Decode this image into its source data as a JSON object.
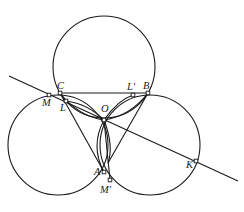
{
  "diagram": {
    "type": "geometry",
    "colors": {
      "stroke": "#1a1a1a",
      "background": "#ffffff",
      "point_fill": "#ffffff"
    },
    "circles": [
      {
        "id": "top",
        "cx": 104,
        "cy": 67,
        "r": 51
      },
      {
        "id": "left",
        "cx": 58,
        "cy": 145,
        "r": 50
      },
      {
        "id": "right",
        "cx": 150,
        "cy": 145,
        "r": 50
      }
    ],
    "points": [
      {
        "id": "C",
        "label": "C",
        "x": 60,
        "y": 93,
        "lx": 57,
        "ly": 89
      },
      {
        "id": "B",
        "label": "B",
        "x": 148,
        "y": 93,
        "lx": 143,
        "ly": 89
      },
      {
        "id": "M",
        "label": "M",
        "x": 49,
        "y": 95,
        "lx": 42,
        "ly": 106
      },
      {
        "id": "L",
        "label": "L",
        "x": 66,
        "y": 101,
        "lx": 60,
        "ly": 111
      },
      {
        "id": "L_prime",
        "label": "L'",
        "x": 133,
        "y": 95,
        "lx": 127,
        "ly": 90
      },
      {
        "id": "O",
        "label": "O",
        "x": 104,
        "y": 120,
        "lx": 101,
        "ly": 112
      },
      {
        "id": "A",
        "label": "A",
        "x": 104,
        "y": 172,
        "lx": 94,
        "ly": 175
      },
      {
        "id": "M_prime",
        "label": "M'",
        "x": 110,
        "y": 180,
        "lx": 100,
        "ly": 193
      },
      {
        "id": "K",
        "label": "K",
        "x": 196,
        "y": 161,
        "lx": 186,
        "ly": 168
      }
    ],
    "segments": [
      {
        "id": "line-MK",
        "x1": 9,
        "y1": 76,
        "x2": 238,
        "y2": 181
      },
      {
        "id": "seg-CB",
        "x1": 60,
        "y1": 93,
        "x2": 148,
        "y2": 93
      },
      {
        "id": "seg-CA",
        "x1": 60,
        "y1": 93,
        "x2": 104,
        "y2": 172
      },
      {
        "id": "seg-BA",
        "x1": 148,
        "y1": 93,
        "x2": 108,
        "y2": 163
      },
      {
        "id": "seg-OM_prime",
        "x1": 104,
        "y1": 120,
        "x2": 110,
        "y2": 180
      }
    ],
    "arcs": [
      {
        "id": "arc-C-O-lower",
        "d": "M 60 93 Q 78 116 104 120"
      },
      {
        "id": "arc-L-O",
        "d": "M 66 101 Q 88 104 104 120"
      },
      {
        "id": "arc-O-B-lower",
        "d": "M 104 120 Q 130 116 148 93"
      },
      {
        "id": "arc-O-Lp",
        "d": "M 104 120 Q 118 100 133 95"
      },
      {
        "id": "arc-O-A-left",
        "d": "M 104 120 Q 90 146 104 172"
      },
      {
        "id": "arc-O-A-right",
        "d": "M 104 120 Q 114 146 108 163"
      }
    ]
  }
}
